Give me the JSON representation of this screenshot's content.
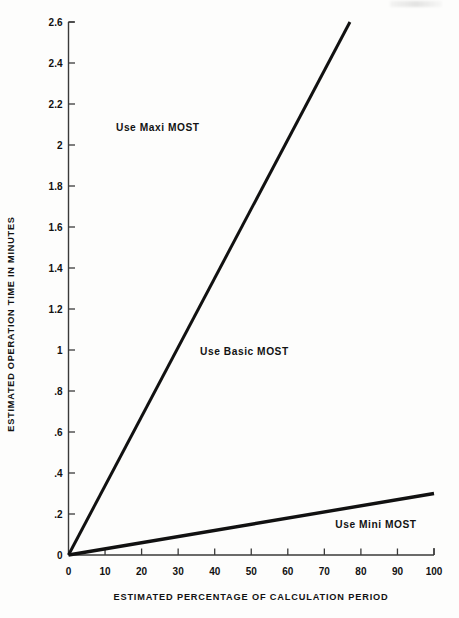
{
  "chart_data": {
    "type": "line",
    "title": "",
    "xlabel": "ESTIMATED PERCENTAGE OF CALCULATION PERIOD",
    "ylabel": "ESTIMATED OPERATION TIME IN MINUTES",
    "xlim": [
      0,
      100
    ],
    "ylim": [
      0,
      2.6
    ],
    "xticks": [
      0,
      10,
      20,
      30,
      40,
      50,
      60,
      70,
      80,
      90,
      100
    ],
    "xticklabels": [
      "0",
      "10",
      "20",
      "30",
      "40",
      "50",
      "60",
      "70",
      "80",
      "90",
      "100"
    ],
    "yticks": [
      0,
      0.2,
      0.4,
      0.6,
      0.8,
      1,
      1.2,
      1.4,
      1.6,
      1.8,
      2,
      2.2,
      2.4,
      2.6
    ],
    "yticklabels": [
      "0",
      ".2",
      ".4",
      ".6",
      ".8",
      "1",
      "1.2",
      "1.4",
      "1.6",
      "1.8",
      "2",
      "2.2",
      "2.4",
      "2.6"
    ],
    "grid": false,
    "legend": null,
    "series": [
      {
        "name": "Maxi/Basic boundary",
        "x": [
          0,
          77
        ],
        "y": [
          0,
          2.6
        ],
        "color": "#111111",
        "width": 3.0
      },
      {
        "name": "Basic/Mini boundary",
        "x": [
          0,
          100
        ],
        "y": [
          0,
          0.3
        ],
        "color": "#111111",
        "width": 3.4
      }
    ],
    "annotations": [
      {
        "text": "Use Maxi MOST",
        "x": 13,
        "y": 2.11
      },
      {
        "text": "Use Basic MOST",
        "x": 36,
        "y": 1.02
      },
      {
        "text": "Use Mini MOST",
        "x": 73,
        "y": 0.175
      }
    ]
  },
  "axes": {
    "y_title": "ESTIMATED OPERATION TIME IN MINUTES",
    "x_title": "ESTIMATED PERCENTAGE OF CALCULATION PERIOD"
  },
  "colors": {
    "background": "#fdfdfc",
    "ink": "#111111",
    "axis": "#3a3a3a"
  }
}
